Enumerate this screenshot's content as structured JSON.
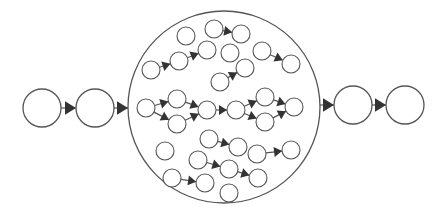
{
  "diagram": {
    "title": "",
    "colors": {
      "background": "#ffffff",
      "stroke": "#555555",
      "arrow": "#333333"
    },
    "container": {
      "id": "pool",
      "cx": 224,
      "cy": 107,
      "r": 96
    },
    "outer_nodes": [
      {
        "id": "in1",
        "cx": 42,
        "cy": 108,
        "r": 19
      },
      {
        "id": "in2",
        "cx": 95,
        "cy": 108,
        "r": 19
      },
      {
        "id": "out1",
        "cx": 353,
        "cy": 105,
        "r": 19
      },
      {
        "id": "out2",
        "cx": 405,
        "cy": 105,
        "r": 19
      }
    ],
    "outer_edges": [
      {
        "from": "in1",
        "to": "in2"
      },
      {
        "from": "in2",
        "to": "pool"
      },
      {
        "from": "pool",
        "to": "out1"
      },
      {
        "from": "out1",
        "to": "out2"
      }
    ],
    "inner_nodes": [
      {
        "id": "a1",
        "cx": 186,
        "cy": 36
      },
      {
        "id": "a2",
        "cx": 214,
        "cy": 29
      },
      {
        "id": "a3",
        "cx": 241,
        "cy": 34
      },
      {
        "id": "b1",
        "cx": 151,
        "cy": 70
      },
      {
        "id": "b2",
        "cx": 179,
        "cy": 61
      },
      {
        "id": "b3",
        "cx": 207,
        "cy": 50
      },
      {
        "id": "b4",
        "cx": 230,
        "cy": 53
      },
      {
        "id": "c1",
        "cx": 262,
        "cy": 51
      },
      {
        "id": "c2",
        "cx": 291,
        "cy": 64
      },
      {
        "id": "d1",
        "cx": 220,
        "cy": 82
      },
      {
        "id": "d2",
        "cx": 245,
        "cy": 68
      },
      {
        "id": "m1",
        "cx": 146,
        "cy": 108
      },
      {
        "id": "m2",
        "cx": 177,
        "cy": 99
      },
      {
        "id": "m3",
        "cx": 177,
        "cy": 124
      },
      {
        "id": "m4",
        "cx": 207,
        "cy": 110
      },
      {
        "id": "m5",
        "cx": 236,
        "cy": 110
      },
      {
        "id": "m6",
        "cx": 265,
        "cy": 97
      },
      {
        "id": "m7",
        "cx": 265,
        "cy": 122
      },
      {
        "id": "m8",
        "cx": 294,
        "cy": 107
      },
      {
        "id": "e1",
        "cx": 209,
        "cy": 139
      },
      {
        "id": "e2",
        "cx": 238,
        "cy": 147
      },
      {
        "id": "f1",
        "cx": 165,
        "cy": 151
      },
      {
        "id": "g1",
        "cx": 198,
        "cy": 160
      },
      {
        "id": "g2",
        "cx": 229,
        "cy": 169
      },
      {
        "id": "g3",
        "cx": 258,
        "cy": 178
      },
      {
        "id": "h1",
        "cx": 257,
        "cy": 154
      },
      {
        "id": "h2",
        "cx": 291,
        "cy": 150
      },
      {
        "id": "i1",
        "cx": 172,
        "cy": 178
      },
      {
        "id": "i2",
        "cx": 205,
        "cy": 183
      },
      {
        "id": "j1",
        "cx": 229,
        "cy": 193
      }
    ],
    "inner_radius": 9,
    "inner_edges": [
      {
        "from": "a2",
        "to": "a3"
      },
      {
        "from": "b1",
        "to": "b2"
      },
      {
        "from": "b2",
        "to": "b3"
      },
      {
        "from": "c1",
        "to": "c2"
      },
      {
        "from": "d1",
        "to": "d2"
      },
      {
        "from": "m1",
        "to": "m2"
      },
      {
        "from": "m1",
        "to": "m3"
      },
      {
        "from": "m2",
        "to": "m4"
      },
      {
        "from": "m3",
        "to": "m4"
      },
      {
        "from": "m4",
        "to": "m5"
      },
      {
        "from": "m5",
        "to": "m6"
      },
      {
        "from": "m5",
        "to": "m7"
      },
      {
        "from": "m6",
        "to": "m8"
      },
      {
        "from": "m7",
        "to": "m8"
      },
      {
        "from": "e1",
        "to": "e2"
      },
      {
        "from": "g1",
        "to": "g2"
      },
      {
        "from": "g2",
        "to": "g3"
      },
      {
        "from": "h1",
        "to": "h2"
      },
      {
        "from": "i1",
        "to": "i2"
      }
    ]
  }
}
